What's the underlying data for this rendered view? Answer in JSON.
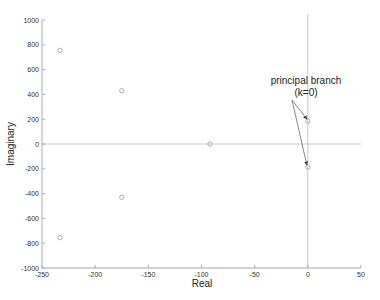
{
  "chart_data": {
    "type": "scatter",
    "title": "",
    "xlabel": "Real",
    "ylabel": "Imaginary",
    "xlim": [
      -250,
      50
    ],
    "ylim": [
      -1000,
      1000
    ],
    "xticks": [
      -250,
      -200,
      -150,
      -100,
      -50,
      0,
      50
    ],
    "yticks": [
      -1000,
      -800,
      -600,
      -400,
      -200,
      0,
      200,
      400,
      600,
      800,
      1000
    ],
    "grid": false,
    "reference_lines": {
      "x": 0,
      "y": 0
    },
    "series": [
      {
        "name": "roots",
        "marker": "circle",
        "points": [
          {
            "x": -233,
            "y": 755
          },
          {
            "x": -233,
            "y": -755
          },
          {
            "x": -175,
            "y": 430
          },
          {
            "x": -175,
            "y": -430
          },
          {
            "x": -92,
            "y": 0
          },
          {
            "x": 0,
            "y": 185
          },
          {
            "x": 0,
            "y": -185
          }
        ]
      }
    ],
    "annotations": [
      {
        "text": "principal branch",
        "x": 0,
        "y": 185
      },
      {
        "text": "(k=0)",
        "x": 0,
        "y": -185
      }
    ]
  },
  "annotation": {
    "line1": "principal branch",
    "line2": "(k=0)"
  },
  "colors": {
    "axis": "#aaaaaa",
    "marker": "#999999",
    "text": "#222222",
    "refline": "#bbbbbb"
  }
}
